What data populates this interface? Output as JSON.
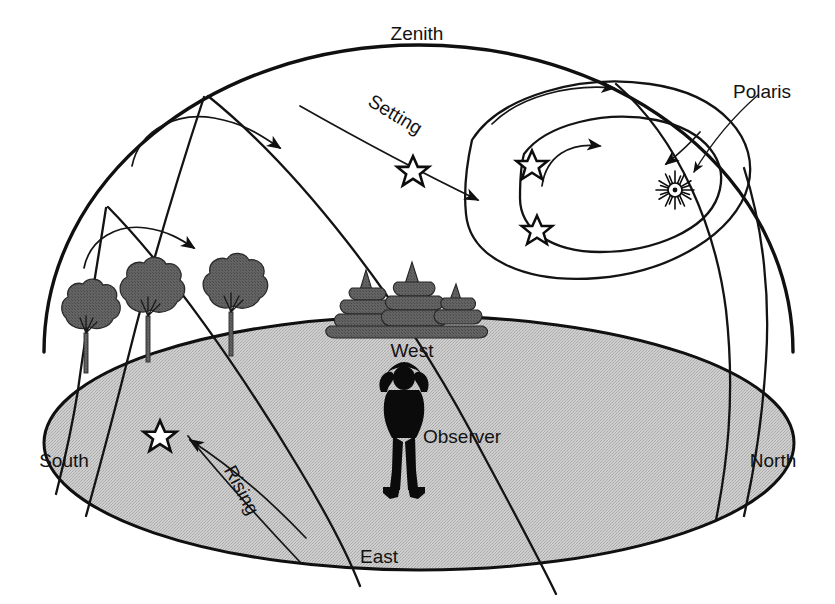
{
  "figure": {
    "title_visible": "",
    "domain_kind": "astronomy-diagram",
    "background_color": "#ffffff",
    "ink_color": "#101010",
    "ground_fill_color": "#c6c6c6",
    "tree_color": "#5c5c5c",
    "observer_color": "#0b0b0b"
  },
  "labels": {
    "zenith": "Zenith",
    "polaris": "Polaris",
    "setting": "Setting",
    "rising": "Rising",
    "west": "West",
    "east": "East",
    "south": "South",
    "north": "North",
    "observer": "Observer"
  },
  "elements": {
    "dome": "celestial-hemisphere-dome",
    "ground_plane": "horizon-ground-ellipse",
    "polaris_symbol": "starburst-with-center-dot",
    "star_symbol": "five-pointed-open-star",
    "pointer": "polaris-leader-arrow",
    "star_count_visible": 5,
    "trees_deciduous": 3,
    "trees_conifer": 7
  },
  "star_paths": [
    {
      "name": "circumpolar-inner",
      "direction": "counterclockwise-around-polaris",
      "arrows": 1
    },
    {
      "name": "circumpolar-outer",
      "direction": "counterclockwise-around-polaris",
      "arrows": 1
    },
    {
      "name": "setting-path-high",
      "direction": "east-to-west-descending",
      "arrows": 1
    },
    {
      "name": "arc-south-upper",
      "direction": "rising-to-setting",
      "arrows": 1
    },
    {
      "name": "arc-south-lower",
      "direction": "rising-to-setting",
      "arrows": 1
    },
    {
      "name": "rising-arrow-ground",
      "direction": "east-to-south-rising",
      "arrows": 1
    }
  ]
}
